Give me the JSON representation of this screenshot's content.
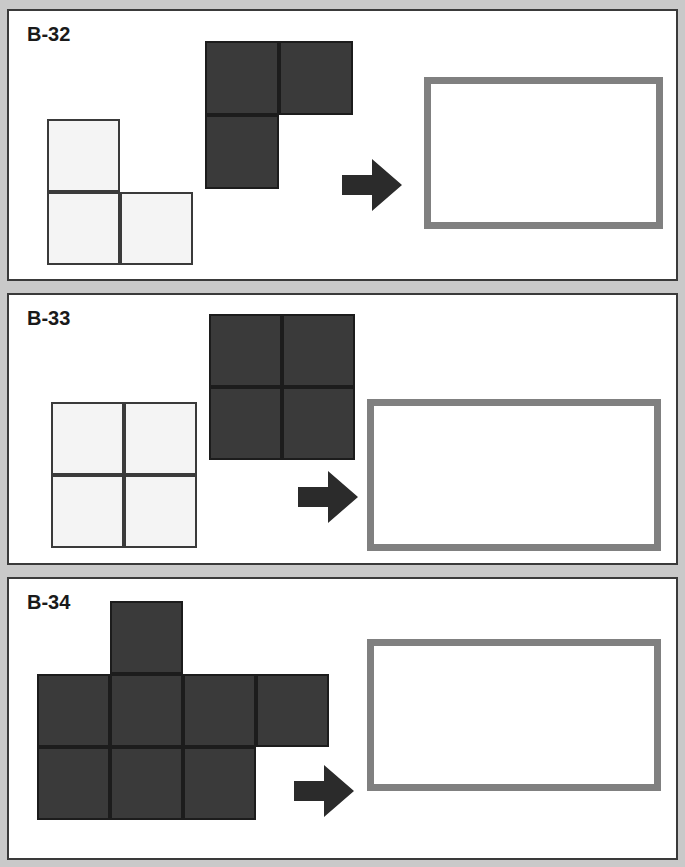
{
  "page": {
    "background_color": "#c9c9c9",
    "width": 685,
    "height": 867
  },
  "colors": {
    "dark_fill": "#3a3a3a",
    "dark_stroke": "#1c1c1c",
    "light_fill": "#f4f4f4",
    "light_stroke": "#3a3a3a",
    "target_border": "#808080",
    "arrow": "#2b2b2b",
    "panel_border": "#3a3a3a",
    "panel_fill": "#ffffff"
  },
  "panels": [
    {
      "id": "panel-b-32",
      "label": "B-32",
      "label_x": 18,
      "label_y": 12,
      "rect": {
        "x": 7,
        "y": 9,
        "w": 671,
        "h": 272
      },
      "light_piece": {
        "name": "light-l-tromino",
        "x": 38,
        "y": 108,
        "cell": 73,
        "cells": [
          [
            0,
            0
          ],
          [
            0,
            1
          ],
          [
            1,
            1
          ]
        ]
      },
      "dark_piece": {
        "name": "dark-l-tromino",
        "x": 196,
        "y": 30,
        "cell": 74,
        "cells": [
          [
            0,
            0
          ],
          [
            1,
            0
          ],
          [
            0,
            1
          ]
        ]
      },
      "arrow": {
        "x": 333,
        "y": 146,
        "w": 60,
        "h": 56
      },
      "target": {
        "x": 415,
        "y": 66,
        "w": 239,
        "h": 152
      }
    },
    {
      "id": "panel-b-33",
      "label": "B-33",
      "label_x": 18,
      "label_y": 12,
      "rect": {
        "x": 7,
        "y": 293,
        "w": 671,
        "h": 272
      },
      "light_piece": {
        "name": "light-square-tetromino",
        "x": 42,
        "y": 107,
        "cell": 73,
        "cells": [
          [
            0,
            0
          ],
          [
            1,
            0
          ],
          [
            0,
            1
          ],
          [
            1,
            1
          ]
        ]
      },
      "dark_piece": {
        "name": "dark-square-tetromino",
        "x": 200,
        "y": 19,
        "cell": 73,
        "cells": [
          [
            0,
            0
          ],
          [
            1,
            0
          ],
          [
            0,
            1
          ],
          [
            1,
            1
          ]
        ]
      },
      "arrow": {
        "x": 289,
        "y": 174,
        "w": 60,
        "h": 56
      },
      "target": {
        "x": 358,
        "y": 104,
        "w": 294,
        "h": 152
      }
    },
    {
      "id": "panel-b-34",
      "label": "B-34",
      "label_x": 18,
      "label_y": 12,
      "rect": {
        "x": 7,
        "y": 577,
        "w": 671,
        "h": 283
      },
      "light_piece": null,
      "dark_piece": {
        "name": "dark-heptomino",
        "x": 28,
        "y": 22,
        "cell": 73,
        "cells": [
          [
            1,
            0
          ],
          [
            0,
            1
          ],
          [
            1,
            1
          ],
          [
            2,
            1
          ],
          [
            3,
            1
          ],
          [
            0,
            2
          ],
          [
            1,
            2
          ],
          [
            2,
            2
          ]
        ]
      },
      "arrow": {
        "x": 285,
        "y": 184,
        "w": 60,
        "h": 56
      },
      "target": {
        "x": 358,
        "y": 60,
        "w": 294,
        "h": 152
      }
    }
  ],
  "icons": {
    "arrow_right": "arrow-right-icon"
  }
}
